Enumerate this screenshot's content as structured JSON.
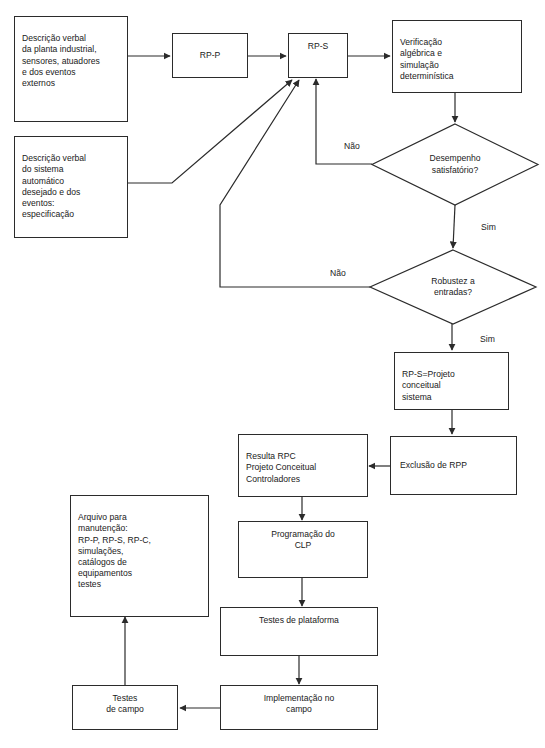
{
  "diagram": {
    "stroke_color": "#2b2b2b",
    "text_color": "#1a1a1a",
    "background_color": "#ffffff",
    "nodes": {
      "planta": "Descrição verbal\nda planta industrial,\nsensores, atuadores\ne dos eventos\nexternos",
      "especificacao": "Descrição verbal\ndo sistema\nautomático\ndesejado e dos\neventos:\nespecificação",
      "rpp": "RP-P",
      "rps": "RP-S",
      "verificacao": "Verificação\nalgébrica e\nsimulação\ndeterminística",
      "desempenho": "Desempenho\nsatisfatório?",
      "robustez": "Robustez a\nentradas?",
      "projeto_conceitual": "RP-S=Projeto\nconceitual\nsistema",
      "exclusao": "Exclusão de RPP",
      "resulta_rpc": "Resulta RPC\nProjeto Conceitual\nControladores",
      "programacao": "Programação do\nCLP",
      "arquivo": "Arquivo para\nmanutenção:\nRP-P, RP-S, RP-C,\nsimulações,\ncatálogos de\nequipamentos\ntestes",
      "testes_plataforma": "Testes de plataforma",
      "implementacao": "Implementação no\ncampo",
      "testes_campo": "Testes\nde campo"
    },
    "edge_labels": {
      "nao_desempenho": "Não",
      "sim_desempenho": "Sim",
      "nao_robustez": "Não",
      "sim_robustez": "Sim"
    }
  }
}
